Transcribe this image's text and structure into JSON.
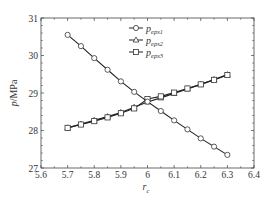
{
  "chart_data": {
    "type": "line",
    "title": "",
    "xlabel": "r_c",
    "xlabel_main": "r",
    "xlabel_sub": "c",
    "ylabel": "p/MPa",
    "ylabel_italic": "p",
    "ylabel_rest": "/MPa",
    "xlim": [
      5.6,
      6.4
    ],
    "ylim": [
      27,
      31
    ],
    "xticks": [
      5.6,
      5.7,
      5.8,
      5.9,
      6,
      6.1,
      6.2,
      6.3,
      6.4
    ],
    "xtick_labels": [
      "5.6",
      "5.7",
      "5.8",
      "5.9",
      "6",
      "6.1",
      "6.2",
      "6.3",
      "6.4"
    ],
    "yticks": [
      27,
      28,
      29,
      30,
      31
    ],
    "ytick_labels": [
      "27",
      "28",
      "29",
      "30",
      "31"
    ],
    "grid": false,
    "legend_position": "top-right",
    "x": [
      5.7,
      5.75,
      5.8,
      5.85,
      5.9,
      5.95,
      6.0,
      6.05,
      6.1,
      6.15,
      6.2,
      6.25,
      6.3
    ],
    "series": [
      {
        "name": "p_eps1",
        "label_main": "p",
        "label_sub": "eps1",
        "marker": "circle",
        "values": [
          30.55,
          30.25,
          29.93,
          29.62,
          29.31,
          29.03,
          28.77,
          28.52,
          28.27,
          28.03,
          27.79,
          27.57,
          27.35
        ]
      },
      {
        "name": "p_eps2",
        "label_main": "p",
        "label_sub": "eps2",
        "marker": "triangle",
        "values": [
          28.07,
          28.17,
          28.27,
          28.37,
          28.48,
          28.62,
          28.76,
          28.87,
          28.99,
          29.11,
          29.23,
          29.36,
          29.49
        ]
      },
      {
        "name": "p_eps3",
        "label_main": "p",
        "label_sub": "eps3",
        "marker": "square",
        "values": [
          28.07,
          28.16,
          28.25,
          28.35,
          28.46,
          28.59,
          28.84,
          28.91,
          29.01,
          29.12,
          29.23,
          29.35,
          29.48
        ]
      }
    ]
  }
}
